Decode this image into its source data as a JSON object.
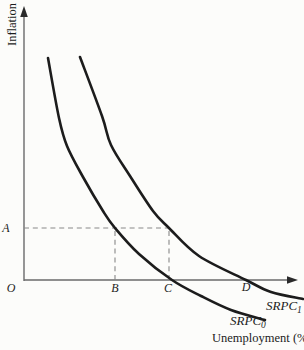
{
  "figure": {
    "background": "#fcfcfa",
    "curve_color": "#1c1c1c",
    "axis_color": "#6a6a6a",
    "arrow_color": "#2a2a2a",
    "dash_color": "#878787",
    "text_color": "#1c1c1c"
  },
  "axes": {
    "y_axis_label": "Inflation",
    "x_axis_label": "Unemployment (%)",
    "origin_label": "O"
  },
  "chart_data": {
    "type": "line",
    "title": "",
    "xlabel": "Unemployment (%)",
    "ylabel": "Inflation",
    "axis_numeric": false,
    "grid": false,
    "legend_position": "labels-on-curves",
    "series": [
      {
        "name": "SRPC0",
        "label_base": "SRPC",
        "label_sub": "0",
        "points_px": [
          [
            48,
            58
          ],
          [
            59,
            118
          ],
          [
            67,
            146
          ],
          [
            83,
            177
          ],
          [
            103,
            211
          ],
          [
            115,
            228
          ],
          [
            139,
            254
          ],
          [
            172,
            280
          ],
          [
            201,
            296
          ],
          [
            231,
            310
          ],
          [
            265,
            320
          ]
        ],
        "label_pos_px": [
          230,
          325
        ]
      },
      {
        "name": "SRPC1",
        "label_base": "SRPC",
        "label_sub": "1",
        "points_px": [
          [
            80,
            57
          ],
          [
            102,
            116
          ],
          [
            111,
            145
          ],
          [
            130,
            176
          ],
          [
            153,
            211
          ],
          [
            169,
            228
          ],
          [
            199,
            256
          ],
          [
            246,
            280
          ],
          [
            271,
            292
          ],
          [
            303,
            299
          ]
        ],
        "label_pos_px": [
          266,
          310
        ]
      }
    ],
    "guides": [
      {
        "name": "a-level-dash",
        "x1": 24,
        "y1": 228,
        "x2": 169,
        "y2": 228
      },
      {
        "name": "b-drop-dash",
        "x1": 115,
        "y1": 280,
        "x2": 115,
        "y2": 228
      },
      {
        "name": "c-drop-dash",
        "x1": 169,
        "y1": 280,
        "x2": 169,
        "y2": 228
      }
    ],
    "point_labels": [
      {
        "text": "O",
        "x": 11,
        "y": 292
      },
      {
        "text": "A",
        "x": 6,
        "y": 232
      },
      {
        "text": "B",
        "x": 115,
        "y": 292
      },
      {
        "text": "C",
        "x": 168,
        "y": 292
      },
      {
        "text": "D",
        "x": 246,
        "y": 291
      }
    ]
  }
}
